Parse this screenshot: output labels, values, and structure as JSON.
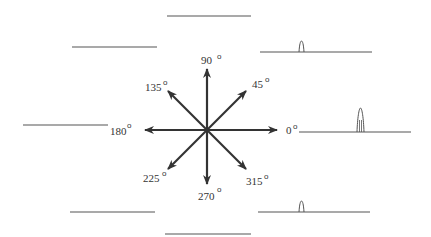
{
  "diagram": {
    "type": "direction-tuning-diagram",
    "center": {
      "x": 207,
      "y": 130
    },
    "arrow_color": "#333333",
    "line_color": "#555555",
    "directions": [
      {
        "label": "0",
        "angle": 0
      },
      {
        "label": "45",
        "angle": 45
      },
      {
        "label": "90",
        "angle": 90
      },
      {
        "label": "135",
        "angle": 135
      },
      {
        "label": "180",
        "angle": 180
      },
      {
        "label": "225",
        "angle": 225
      },
      {
        "label": "270",
        "angle": 270
      },
      {
        "label": "315",
        "angle": 315
      }
    ],
    "degree_symbol": "o",
    "traces": [
      {
        "direction": "90",
        "spike": "none"
      },
      {
        "direction": "135",
        "spike": "none"
      },
      {
        "direction": "45",
        "spike": "small"
      },
      {
        "direction": "180",
        "spike": "none"
      },
      {
        "direction": "0",
        "spike": "large"
      },
      {
        "direction": "225",
        "spike": "none"
      },
      {
        "direction": "315",
        "spike": "small"
      },
      {
        "direction": "270",
        "spike": "none"
      }
    ]
  }
}
